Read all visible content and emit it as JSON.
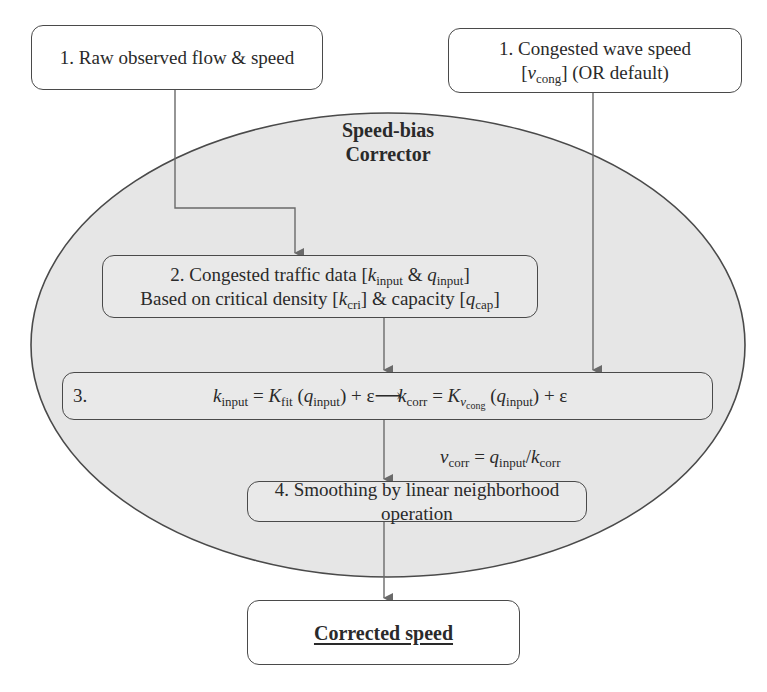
{
  "diagram": {
    "title": "Speed-bias Corrector",
    "title_line1": "Speed-bias",
    "title_line2": "Corrector",
    "colors": {
      "ellipse_fill": "#e6e6e6",
      "stroke": "#4a4a4a",
      "arrow": "#6a6a6a",
      "inner_box_fill": "#e9e9e9",
      "outer_box_fill": "#ffffff"
    },
    "inputs": [
      {
        "id": "raw-flow",
        "label": "1. Raw observed flow & speed"
      },
      {
        "id": "wave-speed",
        "line1": "1. Congested wave speed",
        "line2_prefix": "[",
        "symbol": "v",
        "symbol_sub": "cong",
        "line2_suffix": "] (OR default)"
      }
    ],
    "step2": {
      "line1_prefix": "2. Congested traffic data [",
      "k": "k",
      "k_sub": "input",
      "amp": " & ",
      "q": "q",
      "q_sub": "input",
      "line1_suffix": "]",
      "line2_prefix": "Based on critical density [",
      "kcri": "k",
      "kcri_sub": "cri",
      "line2_mid": "] & capacity [",
      "qcap": "q",
      "qcap_sub": "cap",
      "line2_suffix": "]"
    },
    "step3": {
      "label": "3.",
      "eq1": {
        "lhs": "k",
        "lhs_sub": "input",
        "eq": " = ",
        "fn": "K",
        "fn_sub": "fit",
        "arg_open": " (",
        "arg": "q",
        "arg_sub": "input",
        "arg_close": ")",
        "tail": " + ε⟶"
      },
      "eq2": {
        "lhs": "k",
        "lhs_sub": "corr",
        "eq": " = ",
        "fn": "K",
        "fn_sub": "v",
        "fn_subsub": "cong",
        "arg_open": " (",
        "arg": "q",
        "arg_sub": "input",
        "arg_close": ")",
        "tail": " + ε"
      }
    },
    "relation": {
      "lhs": "v",
      "lhs_sub": "corr",
      "eq": " = ",
      "num": "q",
      "num_sub": "input",
      "slash": "/",
      "den": "k",
      "den_sub": "corr"
    },
    "step4": {
      "label": "4. Smoothing by linear neighborhood operation"
    },
    "output": {
      "label": "Corrected speed"
    }
  }
}
